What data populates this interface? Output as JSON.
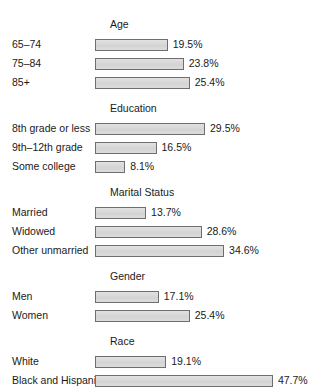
{
  "chart_data": {
    "type": "bar",
    "orientation": "horizontal",
    "title": "",
    "xlabel": "",
    "ylabel": "",
    "value_suffix": "%",
    "xlim": [
      0,
      47.7
    ],
    "grid": false,
    "legend": false,
    "bar_fill_color": "#d8d8d8",
    "bar_border_color": "#6e6e6e",
    "groups": [
      {
        "title": "Age",
        "categories": [
          "65–74",
          "75–84",
          "85+"
        ],
        "values": [
          19.5,
          23.8,
          25.4
        ],
        "labels": [
          "19.5%",
          "23.8%",
          "25.4%"
        ]
      },
      {
        "title": "Education",
        "categories": [
          "8th grade or less",
          "9th–12th grade",
          "Some college"
        ],
        "values": [
          29.5,
          16.5,
          8.1
        ],
        "labels": [
          "29.5%",
          "16.5%",
          "8.1%"
        ]
      },
      {
        "title": "Marital Status",
        "categories": [
          "Married",
          "Widowed",
          "Other unmarried"
        ],
        "values": [
          13.7,
          28.6,
          34.6
        ],
        "labels": [
          "13.7%",
          "28.6%",
          "34.6%"
        ]
      },
      {
        "title": "Gender",
        "categories": [
          "Men",
          "Women"
        ],
        "values": [
          17.1,
          25.4
        ],
        "labels": [
          "17.1%",
          "25.4%"
        ]
      },
      {
        "title": "Race",
        "categories": [
          "White",
          "Black and Hispanic"
        ],
        "values": [
          19.1,
          47.7
        ],
        "labels": [
          "19.1%",
          "47.7%"
        ]
      }
    ]
  }
}
